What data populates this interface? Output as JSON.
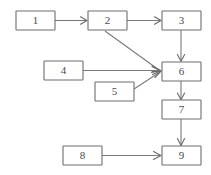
{
  "diagram": {
    "background_color": "#ffffff",
    "box_fill": "#ffffff",
    "box_stroke": "#6e6e6e",
    "edge_color": "#7a7a7a",
    "label_color": "#4a4a4a",
    "nodes": [
      {
        "id": "n1",
        "label": "1",
        "x": 16,
        "y": 11,
        "w": 39,
        "h": 19
      },
      {
        "id": "n2",
        "label": "2",
        "x": 88,
        "y": 11,
        "w": 39,
        "h": 19
      },
      {
        "id": "n3",
        "label": "3",
        "x": 162,
        "y": 11,
        "w": 39,
        "h": 19
      },
      {
        "id": "n4",
        "label": "4",
        "x": 44,
        "y": 61,
        "w": 39,
        "h": 19
      },
      {
        "id": "n5",
        "label": "5",
        "x": 95,
        "y": 82,
        "w": 39,
        "h": 19
      },
      {
        "id": "n6",
        "label": "6",
        "x": 162,
        "y": 62,
        "w": 39,
        "h": 19
      },
      {
        "id": "n7",
        "label": "7",
        "x": 162,
        "y": 100,
        "w": 39,
        "h": 19
      },
      {
        "id": "n8",
        "label": "8",
        "x": 63,
        "y": 146,
        "w": 39,
        "h": 19
      },
      {
        "id": "n9",
        "label": "9",
        "x": 162,
        "y": 146,
        "w": 39,
        "h": 19
      }
    ],
    "edges": [
      {
        "id": "e1",
        "from": "n1",
        "to": "n2",
        "direction": "right"
      },
      {
        "id": "e2",
        "from": "n2",
        "to": "n3",
        "direction": "right"
      },
      {
        "id": "e3",
        "from": "n3",
        "to": "n6",
        "direction": "down"
      },
      {
        "id": "e4",
        "from": "n2",
        "to": "n6",
        "direction": "diagonal-down-right"
      },
      {
        "id": "e5",
        "from": "n4",
        "to": "n6",
        "direction": "right"
      },
      {
        "id": "e6",
        "from": "n5",
        "to": "n6",
        "direction": "diagonal-up-right"
      },
      {
        "id": "e7",
        "from": "n6",
        "to": "n7",
        "direction": "down"
      },
      {
        "id": "e8",
        "from": "n7",
        "to": "n9",
        "direction": "down"
      },
      {
        "id": "e9",
        "from": "n8",
        "to": "n9",
        "direction": "right"
      }
    ]
  }
}
